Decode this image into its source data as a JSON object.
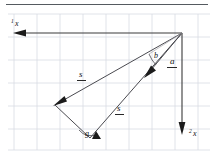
{
  "figure": {
    "background_color": "#ffffff",
    "grid_color": "#d8dce3",
    "line_color": "#4a4a50",
    "text_color": "#101010",
    "width": 214,
    "height": 160
  },
  "axes": [
    {
      "id": "axis-x1",
      "label_letter": "x",
      "label_subscript": "1",
      "orientation": "horizontal",
      "direction": "left",
      "label_x": 12,
      "label_y": 26
    },
    {
      "id": "axis-x2",
      "label_letter": "x",
      "label_subscript": "2",
      "orientation": "vertical",
      "direction": "down",
      "label_x": 192,
      "label_y": 134
    }
  ],
  "vectors": [
    {
      "id": "vector-s-upper",
      "label_letter": "s",
      "notation": "underlined",
      "label_x": 80,
      "label_y": 78,
      "from_x": 182,
      "from_y": 33,
      "to_x": 55,
      "to_y": 105
    },
    {
      "id": "vector-s-lower",
      "label_letter": "s",
      "notation": "underlined",
      "label_x": 118,
      "label_y": 112,
      "from_x": 90,
      "from_y": 138,
      "to_x": 182,
      "to_y": 33
    },
    {
      "id": "vector-a",
      "label_letter": "a",
      "notation": "underlined",
      "label_x": 171,
      "label_y": 65,
      "from_x": 182,
      "from_y": 33,
      "to_x": 147,
      "to_y": 74
    }
  ],
  "angles": [
    {
      "id": "angle-b",
      "label": "b",
      "label_x": 155,
      "label_y": 56,
      "vertex_x": 182,
      "vertex_y": 33
    },
    {
      "id": "angle-g",
      "label": "g",
      "label_x": 87,
      "label_y": 133,
      "vertex_x": 90,
      "vertex_y": 138
    }
  ],
  "grid": {
    "spacing_px": 23,
    "x_start": 14,
    "y_start": 14,
    "visible": true
  }
}
